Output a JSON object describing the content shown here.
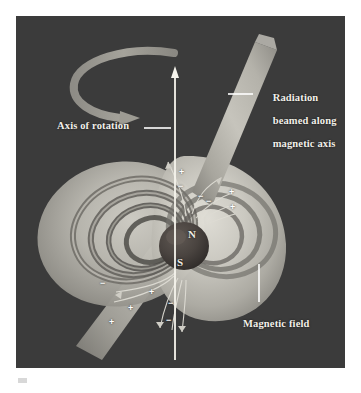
{
  "figure": {
    "kind": "scientific-illustration",
    "panel": {
      "background_color": "#3b3b3b",
      "border_color": "#ffffff"
    }
  },
  "labels": {
    "radiation": "Radiation\nbeamed along\nmagnetic axis",
    "radiation_lines": [
      "Radiation",
      "beamed along",
      "magnetic axis"
    ],
    "axis_of_rotation": "Axis of rotation",
    "magnetic_field": "Magnetic field"
  },
  "star": {
    "north_pole": "N",
    "south_pole": "S",
    "body_color": "#4a4440",
    "center_x": 168,
    "center_y": 230,
    "radius": 24
  },
  "charges": {
    "positive_symbol": "+",
    "negative_symbol": "−",
    "positive_points": [
      {
        "x": 163,
        "y": 152
      },
      {
        "x": 213,
        "y": 172
      },
      {
        "x": 214,
        "y": 187
      },
      {
        "x": 133,
        "y": 272
      },
      {
        "x": 112,
        "y": 288
      },
      {
        "x": 93,
        "y": 302
      }
    ],
    "negative_points": [
      {
        "x": 162,
        "y": 166
      },
      {
        "x": 182,
        "y": 176
      },
      {
        "x": 190,
        "y": 181
      },
      {
        "x": 84,
        "y": 263
      },
      {
        "x": 152,
        "y": 283
      },
      {
        "x": 150,
        "y": 300
      }
    ]
  },
  "elements": {
    "rotation_arrow": "curved-rotation-arrow",
    "axis_arrow": "vertical-axis-arrow",
    "beam": "radiation-beam-cone",
    "magnetosphere": "magnetic-field-lobes",
    "field_lines": "dipole-field-lines"
  },
  "colors": {
    "background": "#3b3b3b",
    "lobe_light": "#c9c7bf",
    "lobe_mid": "#a9a7a0",
    "lobe_dark": "#6f6d68",
    "beam": "#b6b4ac",
    "arrow": "#9a9890",
    "axis_line": "#f5f3ec",
    "label_text": "#f2f0ea",
    "leader_line": "#ffffff"
  }
}
